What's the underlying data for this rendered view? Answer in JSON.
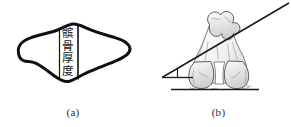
{
  "figure": {
    "background_color": "#ffffff",
    "ink_color": "#1a1a1a",
    "sketch_color": "#4a4a4a"
  },
  "panel_a": {
    "caption": "(a)",
    "measurement_label": "髌骨厚度",
    "shape_name": "patella-cross-section-outline",
    "outline_color": "#101010",
    "outline_width_px": 3
  },
  "panel_b": {
    "caption": "(b)",
    "shape_name": "distal-femur-condyles-sketch",
    "baseline_name": "horizontal-reference-line",
    "angle_line_name": "posterior-condylar-axis-line",
    "angle_marker_name": "angle-wedge-marker",
    "line_color": "#1a1a1a"
  }
}
